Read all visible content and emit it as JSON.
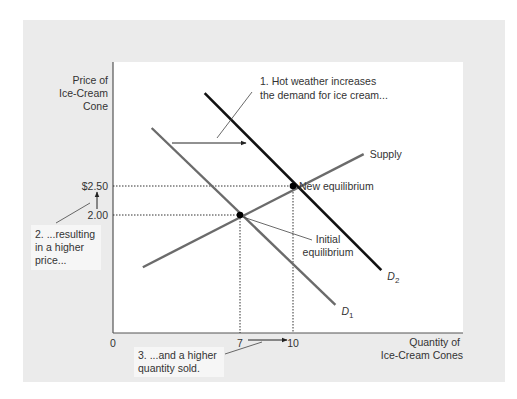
{
  "chart_data": {
    "type": "line",
    "title": "",
    "xlabel": [
      "Quantity of",
      "Ice-Cream Cones"
    ],
    "ylabel": [
      "Price of",
      "Ice-Cream",
      "Cone"
    ],
    "x_ticks": [
      {
        "value": 0,
        "label": "0"
      },
      {
        "value": 7,
        "label": "7"
      },
      {
        "value": 10,
        "label": "10"
      }
    ],
    "y_ticks": [
      {
        "value": 2.0,
        "label": "2.00"
      },
      {
        "value": 2.5,
        "label": "$2.50"
      }
    ],
    "series": [
      {
        "name": "Supply",
        "label": "Supply",
        "color": "#6b6b6b",
        "points": [
          [
            1.5,
            1.1
          ],
          [
            14.0,
            3.05
          ]
        ]
      },
      {
        "name": "D1",
        "label": "D",
        "subscript": "1",
        "color": "#6b6b6b",
        "points": [
          [
            2.0,
            3.5
          ],
          [
            12.4,
            0.45
          ]
        ]
      },
      {
        "name": "D2",
        "label": "D",
        "subscript": "2",
        "color": "#111111",
        "points": [
          [
            5.0,
            4.1
          ],
          [
            15.0,
            1.05
          ]
        ]
      }
    ],
    "equilibria": [
      {
        "name": "Initial equilibrium",
        "label": [
          "Initial",
          "equilibrium"
        ],
        "x": 7,
        "y": 2.0
      },
      {
        "name": "New equilibrium",
        "label": [
          "New equilibrium"
        ],
        "x": 10,
        "y": 2.5
      }
    ],
    "annotations": [
      {
        "id": "note1",
        "lines": [
          "1. Hot weather increases",
          "the demand for ice cream..."
        ]
      },
      {
        "id": "note2",
        "lines": [
          "2. ...resulting",
          "in a higher",
          "price..."
        ]
      },
      {
        "id": "note3",
        "lines": [
          "3. ...and a higher",
          "quantity sold."
        ]
      }
    ],
    "xlim": [
      0,
      18.5
    ],
    "ylim": [
      0,
      4.6
    ],
    "grid": false,
    "legend": "none"
  }
}
